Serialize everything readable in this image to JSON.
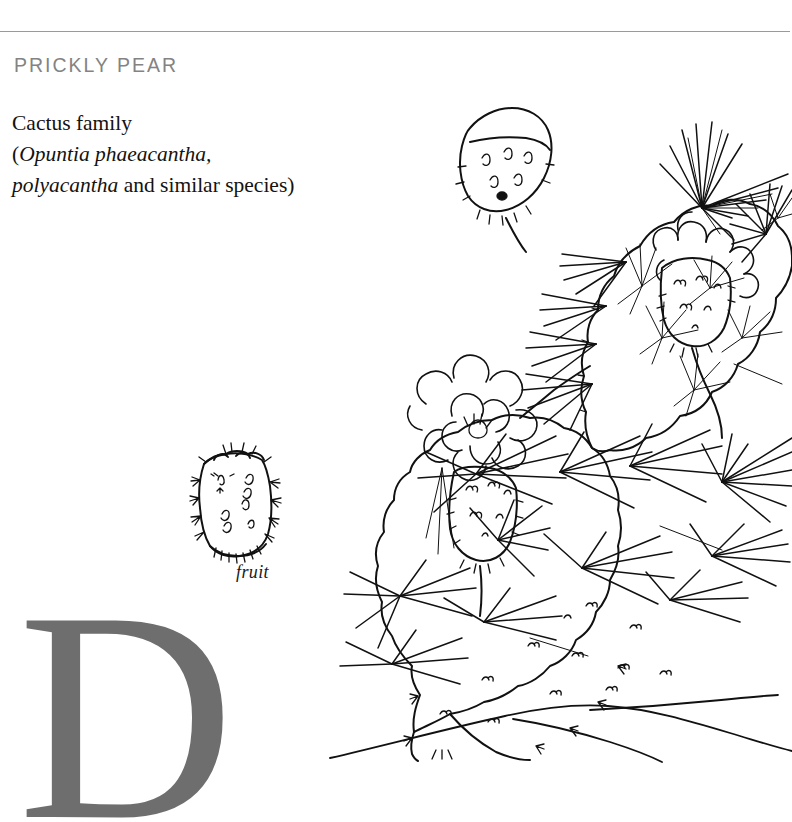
{
  "page": {
    "background_color": "#ffffff",
    "rule_color": "#9a9a9a"
  },
  "header": {
    "title": "PRICKLY PEAR",
    "title_color": "#838383"
  },
  "body": {
    "line1": "Cactus family",
    "line2_open": "(",
    "line2_italic": "Opuntia phaeacantha,",
    "line3_italic": "polyacantha",
    "line3_rest": " and similar species)"
  },
  "figures": {
    "fruit_caption": "fruit",
    "cactus_alt": "prickly-pear-cactus-line-drawing",
    "fruit_alt": "prickly-pear-fruit-line-drawing"
  },
  "dropcap": {
    "letter": "D",
    "color": "#6e6e6e"
  }
}
